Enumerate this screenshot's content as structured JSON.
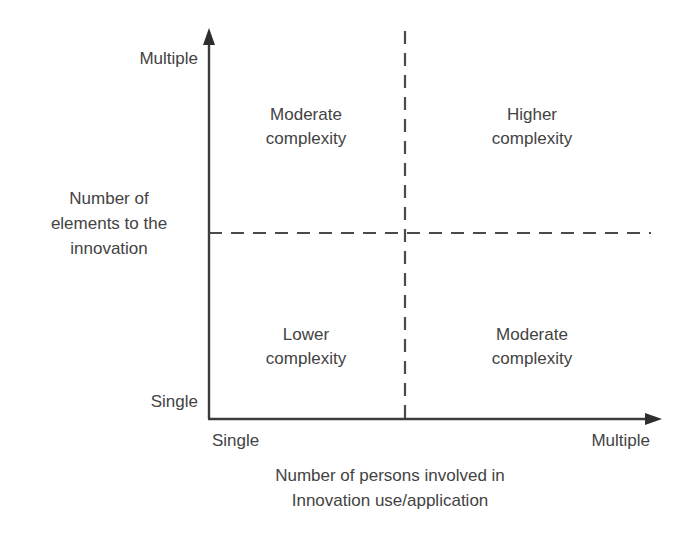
{
  "diagram": {
    "type": "2x2-matrix",
    "title": "",
    "y_axis": {
      "title_lines": [
        "Number of",
        "elements to the",
        "innovation"
      ],
      "low_label": "Single",
      "high_label": "Multiple"
    },
    "x_axis": {
      "title_lines": [
        "Number of persons involved in",
        "Innovation use/application"
      ],
      "low_label": "Single",
      "high_label": "Multiple"
    },
    "quadrants": [
      {
        "id": "top-left",
        "line1": "Moderate",
        "line2": "complexity",
        "x_level": "Single",
        "y_level": "Multiple"
      },
      {
        "id": "top-right",
        "line1": "Higher",
        "line2": "complexity",
        "x_level": "Multiple",
        "y_level": "Multiple"
      },
      {
        "id": "bottom-left",
        "line1": "Lower",
        "line2": "complexity",
        "x_level": "Single",
        "y_level": "Single"
      },
      {
        "id": "bottom-right",
        "line1": "Moderate",
        "line2": "complexity",
        "x_level": "Multiple",
        "y_level": "Single"
      }
    ],
    "colors": {
      "background": "#ffffff",
      "axis": "#3c3c3c",
      "text": "#434343",
      "divider": "#4a4a4a"
    }
  }
}
